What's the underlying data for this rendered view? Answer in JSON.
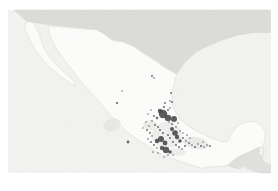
{
  "figure": {
    "type": "map",
    "visible_text": "",
    "canvas": {
      "width": 278,
      "height": 191,
      "background": "#ffffff"
    }
  },
  "map": {
    "frame": {
      "x": 8,
      "y": 10,
      "width": 263,
      "height": 163
    },
    "colors": {
      "ocean": "#f3f3f1",
      "neighbor_land": "#dcdcda",
      "mexico_land": "#fdfdfc",
      "belize_land": "#f4f4f2",
      "border_line": "#cfcfcd",
      "occurrence_dot": "#474747",
      "occurrence_blob": "#424242"
    },
    "regions": [
      {
        "name": "united-states",
        "fill": "#dcdcda",
        "stroke": "#cfcfcd",
        "path": "M 14,10 L 270.5,10 L 270.5,32.5 L 254,32.5 L 238,35 L 222,40 L 208,46 L 196,52 L 185,62 L 177,73.5 L 166,67.5 L 155,59.5 L 143,52 L 133,45.5 L 122,41 L 113,40 L 106,35 L 97,29.5 L 48,24.5 L 27,21.5 L 22,17 L 18,13.5 Z"
      },
      {
        "name": "central-america",
        "fill": "#e0e0de",
        "stroke": "#cfcfcd",
        "path": "M 262.5,147 L 264.5,152 L 262,157.5 L 264,162 L 268,164 L 270.5,164.5 L 270.5,173 L 260,173 L 254,171 L 247,168.5 L 243,166 L 240,168.5 L 234,168 L 228,165 L 232,161.5 L 237.5,157.5 L 244,154 L 251,151 L 257.5,147.5 Z"
      },
      {
        "name": "belize",
        "fill": "#f4f4f2",
        "stroke": "#cfcfcd",
        "path": "M 259.5,147.3 L 262.5,147 L 264,152 L 261.8,157 L 259,154 Z"
      },
      {
        "name": "mexico-mainland",
        "fill": "#fdfdfc",
        "stroke": "#cfcfcd",
        "path": "M 48,26 L 97,30 L 104,34 L 113,40.5 L 122,42 L 133,46 L 143,53 L 155,61 L 166,68.5 L 176.5,74.5 L 174,84 L 171.5,95 L 172.5,105 L 176.5,114 L 182,121 L 190,127 L 198,131.5 L 206,135.5 L 214,139 L 222,142 L 228,141 L 231.5,134 L 236,127.5 L 242,123.5 L 249.5,121.5 L 256.5,122 L 262.5,126.5 L 265.5,133.5 L 264.5,141 L 262.5,147 L 257.5,147.5 L 251,151 L 244,154 L 237.5,157.5 L 232,161.5 L 228,165 L 218,166.5 L 208,167 L 202,168.5 L 196,166.5 L 188,164 L 178,160.5 L 170,157.5 L 162,154.5 L 154,150 L 146,144.5 L 138,140 L 130,134 L 122,127 L 114,119 L 107,111 L 100,103 L 93,95 L 86,87 L 79,79 L 72,70 L 64,60 L 57,50 L 52,40 L 49,32 Z"
      },
      {
        "name": "baja-california-peninsula",
        "fill": "#fdfdfc",
        "stroke": "#cfcfcd",
        "path": "M 27,21.5 L 33,22.5 L 36,27 L 39,34 L 41.5,42 L 45.5,50.5 L 50.5,58.5 L 57.5,66 L 66,73.5 L 73.5,80 L 76,85.5 L 70.5,83 L 62,77.5 L 53,70 L 45,62 L 38,54 L 32,44.5 L 27.5,34.5 L 24.5,27 Z"
      }
    ],
    "terrain_patches": [
      {
        "name": "guadalajara-terrain-patch",
        "cx": 112,
        "cy": 125,
        "rx": 9,
        "ry": 6.5,
        "rot": -15,
        "fill": "#e8e8e6"
      },
      {
        "name": "bajio-terrain-patch",
        "cx": 150,
        "cy": 125,
        "rx": 7,
        "ry": 5,
        "rot": 0,
        "fill": "#ededeb"
      },
      {
        "name": "central-terrain-patch",
        "cx": 167,
        "cy": 135,
        "rx": 15,
        "ry": 13,
        "rot": 0,
        "fill": "#efefed"
      },
      {
        "name": "veracruz-terrain-patch",
        "cx": 196,
        "cy": 143,
        "rx": 13,
        "ry": 6,
        "rot": 10,
        "fill": "#ebebe9"
      },
      {
        "name": "oaxaca-terrain-patch",
        "cx": 178,
        "cy": 152,
        "rx": 8,
        "ry": 4,
        "rot": 5,
        "fill": "#eeeeec"
      }
    ],
    "occurrences": {
      "blobs": [
        [
          163,
          114,
          4.2
        ],
        [
          168,
          118,
          3.2
        ],
        [
          174,
          119,
          3.0
        ],
        [
          160,
          111,
          2.2
        ],
        [
          175,
          133,
          2.8
        ],
        [
          172,
          129,
          2.0
        ],
        [
          161,
          139,
          3.0
        ],
        [
          157,
          141,
          2.2
        ],
        [
          165,
          143,
          2.4
        ],
        [
          166,
          150,
          3.2
        ],
        [
          162,
          148,
          2.2
        ],
        [
          170,
          152,
          1.8
        ],
        [
          177,
          137,
          2.2
        ],
        [
          180,
          141,
          1.8
        ]
      ],
      "points": [
        [
          165,
          103,
          0.9
        ],
        [
          164,
          107,
          1.0
        ],
        [
          170,
          108,
          0.8
        ],
        [
          172,
          102,
          0.9
        ],
        [
          171,
          93,
          0.9
        ],
        [
          170,
          101,
          0.8
        ],
        [
          168,
          110,
          0.9
        ],
        [
          157,
          118,
          1.2
        ],
        [
          154,
          116,
          0.9
        ],
        [
          152,
          121,
          0.8
        ],
        [
          151,
          110,
          0.7
        ],
        [
          148,
          114,
          0.7
        ],
        [
          149,
          126,
          0.8
        ],
        [
          147,
          130,
          0.9
        ],
        [
          150,
          133,
          0.9
        ],
        [
          152,
          136,
          0.8
        ],
        [
          148,
          139,
          0.8
        ],
        [
          151,
          142,
          0.9
        ],
        [
          154,
          145,
          0.9
        ],
        [
          157,
          148,
          0.8
        ],
        [
          153,
          152,
          0.8
        ],
        [
          158,
          153,
          0.8
        ],
        [
          146,
          122,
          0.7
        ],
        [
          143,
          128,
          0.7
        ],
        [
          155,
          125,
          0.9
        ],
        [
          158,
          127,
          0.9
        ],
        [
          160,
          130,
          0.9
        ],
        [
          163,
          133,
          0.9
        ],
        [
          168,
          135,
          0.9
        ],
        [
          170,
          138,
          0.9
        ],
        [
          173,
          142,
          0.9
        ],
        [
          176,
          145,
          0.9
        ],
        [
          179,
          147,
          0.9
        ],
        [
          182,
          149,
          0.8
        ],
        [
          185,
          146,
          0.9
        ],
        [
          183,
          138,
          0.9
        ],
        [
          186,
          141,
          0.8
        ],
        [
          189,
          143,
          0.9
        ],
        [
          192,
          145,
          0.8
        ],
        [
          195,
          147,
          0.9
        ],
        [
          198,
          144,
          0.8
        ],
        [
          201,
          146,
          1.0
        ],
        [
          204,
          147,
          0.8
        ],
        [
          207,
          145,
          0.8
        ],
        [
          210,
          146,
          0.9
        ],
        [
          203,
          142,
          0.7
        ],
        [
          187,
          135,
          0.8
        ],
        [
          190,
          138,
          0.7
        ],
        [
          180,
          131,
          0.8
        ],
        [
          183,
          133,
          0.7
        ],
        [
          176,
          127,
          0.8
        ],
        [
          178,
          123,
          0.8
        ],
        [
          172,
          124,
          0.9
        ],
        [
          169,
          122,
          0.8
        ],
        [
          152,
          76,
          0.9
        ],
        [
          154,
          78,
          0.8
        ],
        [
          117,
          103,
          1.1
        ],
        [
          128,
          142,
          1.4
        ],
        [
          122,
          91,
          0.7
        ],
        [
          164,
          157,
          0.7
        ],
        [
          168,
          155,
          0.8
        ],
        [
          173,
          155,
          0.8
        ]
      ]
    }
  }
}
